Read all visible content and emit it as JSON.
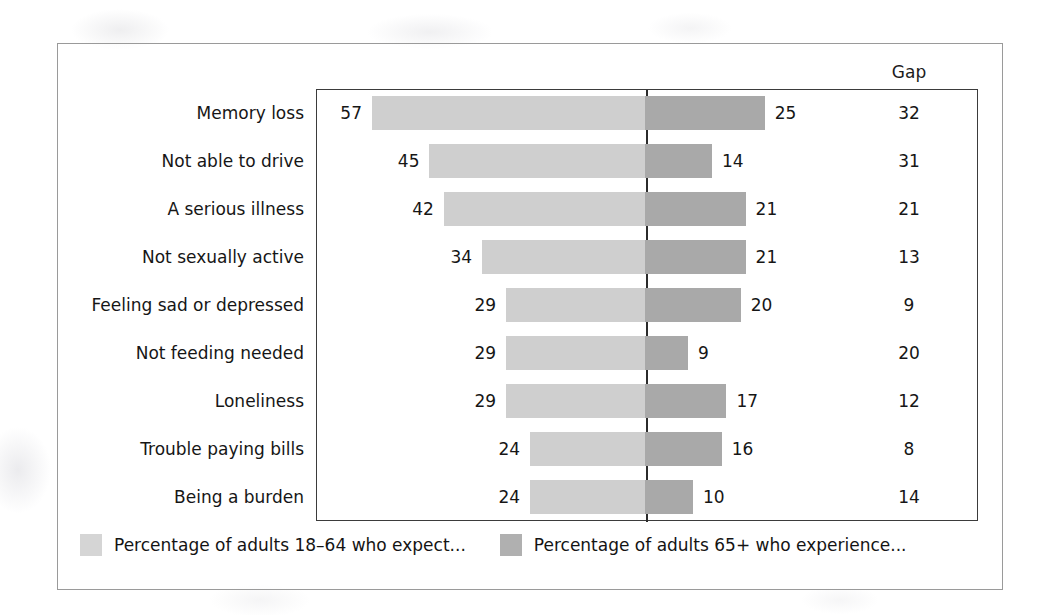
{
  "chart_data": {
    "type": "bar",
    "subtype": "diverging-tornado",
    "title": "",
    "xlabel": "",
    "ylabel": "",
    "grid": false,
    "legend_position": "bottom",
    "axis_center_value": 0,
    "x_unit": "percent",
    "gap_column_header": "Gap",
    "categories": [
      "Memory loss",
      "Not able to drive",
      "A serious illness",
      "Not sexually active",
      "Feeling sad or depressed",
      "Not feeding needed",
      "Loneliness",
      "Trouble paying bills",
      "Being a burden"
    ],
    "series": [
      {
        "name": "Percentage of adults 18–64 who expect...",
        "direction": "left",
        "color": "#cfcfcf",
        "values": [
          57,
          45,
          42,
          34,
          29,
          29,
          29,
          24,
          24
        ]
      },
      {
        "name": "Percentage of adults 65+ who experience...",
        "direction": "right",
        "color": "#a9a9a9",
        "values": [
          25,
          14,
          21,
          21,
          20,
          9,
          17,
          16,
          10
        ]
      }
    ],
    "gap": [
      32,
      31,
      21,
      13,
      9,
      20,
      12,
      8,
      14
    ],
    "rows": [
      {
        "category": "Memory loss",
        "expect": 57,
        "experience": 25,
        "gap": 32
      },
      {
        "category": "Not able to drive",
        "expect": 45,
        "experience": 14,
        "gap": 31
      },
      {
        "category": "A serious illness",
        "expect": 42,
        "experience": 21,
        "gap": 21
      },
      {
        "category": "Not sexually active",
        "expect": 34,
        "experience": 21,
        "gap": 13
      },
      {
        "category": "Feeling sad or depressed",
        "expect": 29,
        "experience": 20,
        "gap": 9
      },
      {
        "category": "Not feeding needed",
        "expect": 29,
        "experience": 9,
        "gap": 20
      },
      {
        "category": "Loneliness",
        "expect": 29,
        "experience": 17,
        "gap": 12
      },
      {
        "category": "Trouble paying bills",
        "expect": 24,
        "experience": 16,
        "gap": 8
      },
      {
        "category": "Being a burden",
        "expect": 24,
        "experience": 10,
        "gap": 14
      }
    ]
  },
  "legend": {
    "items": [
      {
        "label": "Percentage of adults 18–64 who expect...",
        "color": "#d5d5d5"
      },
      {
        "label": "Percentage of adults 65+ who experience...",
        "color": "#b0b0b0"
      }
    ]
  },
  "colors": {
    "bar_left": "#cfcfcf",
    "bar_right": "#a9a9a9",
    "plot_border": "#3b3b3b",
    "center_line": "#2b2b2b",
    "figure_border": "#9a9a9a",
    "text": "#161616"
  },
  "layout": {
    "center_x": 329,
    "px_per_unit": 4.79,
    "row_height": 48,
    "bar_height": 34
  }
}
